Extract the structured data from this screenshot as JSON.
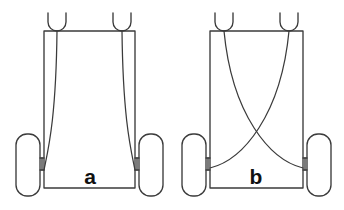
{
  "figure": {
    "background_color": "#ffffff",
    "line_color": "#3b3b3b",
    "label_color": "#111111",
    "width": 344,
    "height": 210
  },
  "panels": [
    {
      "id": "panel-a",
      "label": "a",
      "label_x": 90,
      "label_y": 184,
      "routing": "parallel",
      "routing_description": "Cables run straight down and flare outward near the axles",
      "frame": {
        "x": 44,
        "y": 31,
        "width": 91,
        "height": 157
      },
      "hooks": [
        {
          "name": "hook-left",
          "cx": 57,
          "cy": 31,
          "radius": 9,
          "depth": 18
        },
        {
          "name": "hook-right",
          "cx": 122,
          "cy": 31,
          "radius": 9,
          "depth": 18
        }
      ],
      "wheels": [
        {
          "name": "wheel-left",
          "x": 16,
          "y": 134,
          "width": 24,
          "height": 62,
          "radius": 11
        },
        {
          "name": "wheel-right",
          "x": 139,
          "y": 134,
          "width": 24,
          "height": 62,
          "radius": 11
        }
      ],
      "axles": [
        {
          "name": "axle-left",
          "x1": 40,
          "x2": 44,
          "y_top": 158,
          "y_bottom": 170
        },
        {
          "name": "axle-right",
          "x1": 135,
          "x2": 139,
          "y_top": 158,
          "y_bottom": 170
        }
      ],
      "cables": [
        {
          "name": "cable-left",
          "start_x": 57,
          "start_y": 31,
          "c1_x": 56,
          "c1_y": 120,
          "c2_x": 48,
          "c2_y": 150,
          "end_x": 44,
          "end_y": 170
        },
        {
          "name": "cable-right",
          "start_x": 122,
          "start_y": 31,
          "c1_x": 123,
          "c1_y": 120,
          "c2_x": 131,
          "c2_y": 150,
          "end_x": 135,
          "end_y": 170
        }
      ]
    },
    {
      "id": "panel-b",
      "label": "b",
      "label_x": 256,
      "label_y": 184,
      "routing": "crossed",
      "routing_description": "Cables cross in an X between the hooks and the opposite axles",
      "frame": {
        "x": 210,
        "y": 31,
        "width": 93,
        "height": 157
      },
      "hooks": [
        {
          "name": "hook-left",
          "cx": 224,
          "cy": 31,
          "radius": 9,
          "depth": 18
        },
        {
          "name": "hook-right",
          "cx": 289,
          "cy": 31,
          "radius": 9,
          "depth": 18
        }
      ],
      "wheels": [
        {
          "name": "wheel-left",
          "x": 182,
          "y": 134,
          "width": 24,
          "height": 62,
          "radius": 11
        },
        {
          "name": "wheel-right",
          "x": 307,
          "y": 134,
          "width": 24,
          "height": 62,
          "radius": 11
        }
      ],
      "axles": [
        {
          "name": "axle-left",
          "x1": 206,
          "x2": 210,
          "y_top": 158,
          "y_bottom": 170
        },
        {
          "name": "axle-right",
          "x1": 303,
          "x2": 307,
          "y_top": 158,
          "y_bottom": 170
        }
      ],
      "cables": [
        {
          "name": "cable-left-to-right",
          "start_x": 224,
          "start_y": 31,
          "c1_x": 232,
          "c1_y": 115,
          "c2_x": 270,
          "c2_y": 160,
          "end_x": 303,
          "end_y": 168
        },
        {
          "name": "cable-right-to-left",
          "start_x": 289,
          "start_y": 31,
          "c1_x": 281,
          "c1_y": 115,
          "c2_x": 243,
          "c2_y": 160,
          "end_x": 210,
          "end_y": 168
        }
      ],
      "crossing_point": {
        "x": 256,
        "y": 139
      }
    }
  ]
}
